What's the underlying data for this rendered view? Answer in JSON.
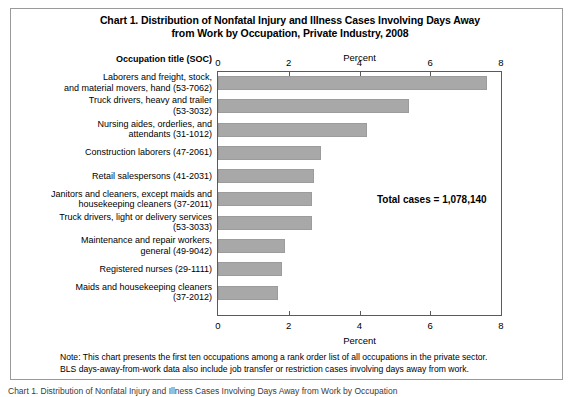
{
  "figure": {
    "title_line1": "Chart 1. Distribution of Nonfatal Injury and Illness Cases Involving Days Away",
    "title_line2": "from Work by Occupation, Private Industry, 2008",
    "occupation_header": "Occupation title (SOC)",
    "annotation": "Total cases = 1,078,140",
    "note_line1": "Note: This chart presents the first ten occupations among a rank order list of all occupations in the private sector.",
    "note_line2": "BLS days-away-from-work data also include job transfer or restriction cases involving days away from work.",
    "bottom_cut_text": "Chart 1. Distribution of Nonfatal Injury and Illness Cases Involving Days Away from Work by Occupation",
    "bar_color": "#a8a8a8",
    "frame_color": "#5a5a5a"
  },
  "chart_data": {
    "type": "bar",
    "orientation": "horizontal",
    "title": "Chart 1. Distribution of Nonfatal Injury and Illness Cases Involving Days Away from Work by Occupation, Private Industry, 2008",
    "xlabel": "Percent",
    "ylabel": "Occupation title (SOC)",
    "xlim": [
      0,
      8
    ],
    "xticks": [
      0,
      2,
      4,
      6,
      8
    ],
    "xticklabels": [
      "0",
      "2",
      "4",
      "6",
      "8"
    ],
    "grid": false,
    "legend": null,
    "axis_top_label": "Percent",
    "axis_bottom_label": "Percent",
    "annotation": "Total cases = 1,078,140",
    "categories": [
      "Laborers and freight, stock, and material movers, hand (53-7062)",
      "Truck drivers, heavy and trailer (53-3032)",
      "Nursing aides, orderlies, and attendants (31-1012)",
      "Construction laborers (47-2061)",
      "Retail salespersons (41-2031)",
      "Janitors and cleaners, except maids and housekeeping cleaners (37-2011)",
      "Truck drivers, light or delivery services (53-3033)",
      "Maintenance and repair workers, general (49-9042)",
      "Registered nurses (29-1111)",
      "Maids and housekeeping cleaners (37-2012)"
    ],
    "category_lines": [
      [
        "Laborers and freight, stock,",
        "and material movers, hand (53-7062)"
      ],
      [
        "Truck drivers, heavy and trailer",
        "(53-3032)"
      ],
      [
        "Nursing aides, orderlies, and",
        "attendants (31-1012)"
      ],
      [
        "Construction laborers (47-2061)"
      ],
      [
        "Retail salespersons (41-2031)"
      ],
      [
        "Janitors and cleaners, except maids and",
        "housekeeping cleaners (37-2011)"
      ],
      [
        "Truck drivers, light or delivery services",
        "(53-3033)"
      ],
      [
        "Maintenance and repair workers,",
        "general (49-9042)"
      ],
      [
        "Registered nurses (29-1111)"
      ],
      [
        "Maids and housekeeping cleaners",
        "(37-2012)"
      ]
    ],
    "values": [
      7.6,
      5.4,
      4.2,
      2.9,
      2.7,
      2.65,
      2.65,
      1.9,
      1.8,
      1.7
    ]
  }
}
